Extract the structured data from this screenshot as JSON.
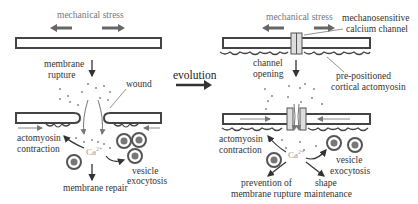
{
  "left_panel": {
    "stress_label": "mechanical stress",
    "rupture_label_1": "membrane",
    "rupture_label_2": "rupture",
    "wound_label": "wound",
    "actomyosin_label_1": "actomyosin",
    "actomyosin_label_2": "contraction",
    "calcium_label": "Ca",
    "calcium_sup": "2+",
    "vesicle_label_1": "vesicle",
    "vesicle_label_2": "exocytosis",
    "repair_label": "membrane repair"
  },
  "center": {
    "evolution_label": "evolution"
  },
  "right_panel": {
    "stress_label": "mechanical stress",
    "channel_label_1": "mechanosensitive",
    "channel_label_2": "calcium channel",
    "opening_label_1": "channel",
    "opening_label_2": "opening",
    "cortical_label_1": "pre-positioned",
    "cortical_label_2": "cortical actomyosin",
    "actomyosin_label_1": "actomyosin",
    "actomyosin_label_2": "contraction",
    "calcium_label": "Ca",
    "calcium_sup": "2+",
    "vesicle_label_1": "vesicle",
    "vesicle_label_2": "exocytosis",
    "prevention_label_1": "prevention of",
    "prevention_label_2": "membrane rupture",
    "shape_label_1": "shape",
    "shape_label_2": "maintenance"
  },
  "colors": {
    "membrane_stroke": "#444444",
    "arrow_grey": "#666666",
    "ion_dots": "#888888",
    "vesicle_fill": "#777777"
  }
}
